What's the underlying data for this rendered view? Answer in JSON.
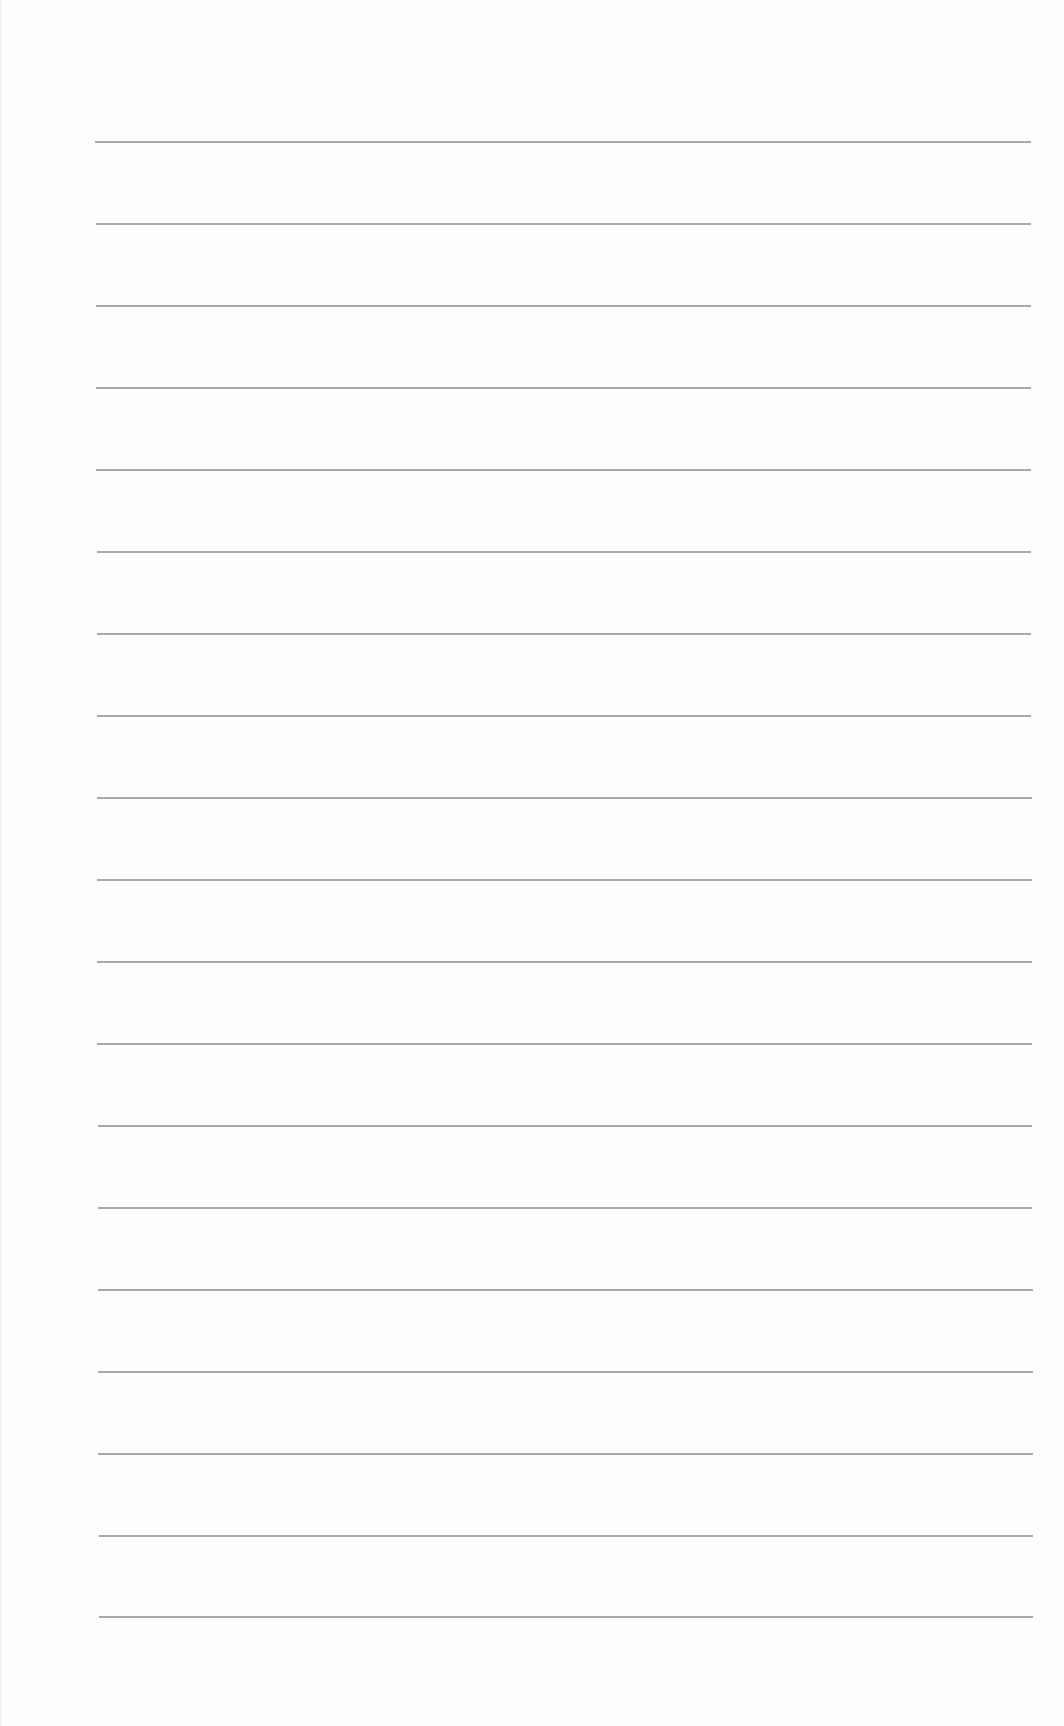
{
  "document": {
    "type": "lined-paper",
    "background_color": "#fefefe",
    "rule_color": "#9a9a9a",
    "rules": [
      {
        "y": 142,
        "x1": 95,
        "x2": 1031
      },
      {
        "y": 224,
        "x1": 96,
        "x2": 1031
      },
      {
        "y": 306,
        "x1": 96,
        "x2": 1031
      },
      {
        "y": 388,
        "x1": 96,
        "x2": 1031
      },
      {
        "y": 470,
        "x1": 96,
        "x2": 1031
      },
      {
        "y": 552,
        "x1": 97,
        "x2": 1031
      },
      {
        "y": 634,
        "x1": 97,
        "x2": 1031
      },
      {
        "y": 716,
        "x1": 97,
        "x2": 1031
      },
      {
        "y": 798,
        "x1": 97,
        "x2": 1032
      },
      {
        "y": 880,
        "x1": 97,
        "x2": 1032
      },
      {
        "y": 962,
        "x1": 97,
        "x2": 1032
      },
      {
        "y": 1044,
        "x1": 97,
        "x2": 1032
      },
      {
        "y": 1126,
        "x1": 98,
        "x2": 1032
      },
      {
        "y": 1208,
        "x1": 98,
        "x2": 1032
      },
      {
        "y": 1290,
        "x1": 98,
        "x2": 1033
      },
      {
        "y": 1372,
        "x1": 98,
        "x2": 1033
      },
      {
        "y": 1454,
        "x1": 98,
        "x2": 1033
      },
      {
        "y": 1536,
        "x1": 99,
        "x2": 1033
      },
      {
        "y": 1617,
        "x1": 99,
        "x2": 1033
      }
    ]
  }
}
